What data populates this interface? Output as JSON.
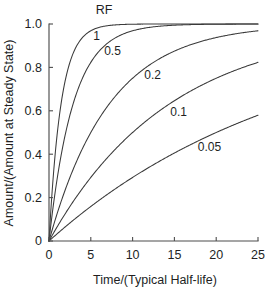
{
  "chart_data": {
    "type": "line",
    "title": "RF",
    "xlabel": "Time/(Typical Half-life)",
    "ylabel": "Amount/(Amount at Steady State)",
    "xlim": [
      0,
      25
    ],
    "ylim": [
      0,
      1.0
    ],
    "grid": false,
    "legend_position": "inline-curve-labels",
    "xticks": [
      0,
      5,
      10,
      15,
      20,
      25
    ],
    "xtick_labels": [
      "0",
      "5",
      "10",
      "15",
      "20",
      "25"
    ],
    "yticks": [
      0,
      0.2,
      0.4,
      0.6,
      0.8,
      1.0
    ],
    "ytick_labels": [
      "0",
      "0.2",
      "0.4",
      "0.6",
      "0.8",
      "1.0"
    ],
    "curve_color": "#3a3a3a",
    "axis_color": "#4d4d4d",
    "background_color": "#ffffff",
    "x": [
      0,
      0.5,
      1,
      1.5,
      2,
      2.5,
      3,
      4,
      5,
      6,
      7,
      8,
      9,
      10,
      11,
      12,
      13,
      14,
      15,
      16,
      17,
      18,
      19,
      20,
      21,
      22,
      23,
      24,
      25
    ],
    "series": [
      {
        "name": "1",
        "rf": 1,
        "label": "1",
        "values": [
          0,
          0.293,
          0.5,
          0.646,
          0.75,
          0.823,
          0.875,
          0.938,
          0.969,
          0.984,
          0.992,
          0.996,
          0.998,
          0.999,
          1.0,
          1.0,
          1.0,
          1.0,
          1.0,
          1.0,
          1.0,
          1.0,
          1.0,
          1.0,
          1.0,
          1.0,
          1.0,
          1.0,
          1.0
        ]
      },
      {
        "name": "0.5",
        "rf": 0.5,
        "label": "0.5",
        "values": [
          0,
          0.159,
          0.293,
          0.407,
          0.5,
          0.58,
          0.646,
          0.75,
          0.823,
          0.875,
          0.912,
          0.938,
          0.956,
          0.969,
          0.978,
          0.984,
          0.989,
          0.992,
          0.994,
          0.996,
          0.997,
          0.998,
          0.999,
          0.999,
          0.999,
          1.0,
          1.0,
          1.0,
          1.0
        ]
      },
      {
        "name": "0.2",
        "rf": 0.2,
        "label": "0.2",
        "values": [
          0,
          0.066,
          0.129,
          0.188,
          0.242,
          0.293,
          0.341,
          0.427,
          0.5,
          0.565,
          0.62,
          0.669,
          0.711,
          0.75,
          0.78,
          0.81,
          0.835,
          0.857,
          0.875,
          0.891,
          0.905,
          0.918,
          0.929,
          0.938,
          0.946,
          0.952,
          0.958,
          0.963,
          0.968
        ]
      },
      {
        "name": "0.1",
        "rf": 0.1,
        "label": "0.1",
        "values": [
          0,
          0.034,
          0.067,
          0.099,
          0.129,
          0.159,
          0.188,
          0.242,
          0.293,
          0.341,
          0.386,
          0.427,
          0.465,
          0.5,
          0.533,
          0.565,
          0.592,
          0.62,
          0.646,
          0.669,
          0.69,
          0.711,
          0.73,
          0.75,
          0.765,
          0.78,
          0.796,
          0.81,
          0.823
        ]
      },
      {
        "name": "0.05",
        "rf": 0.05,
        "label": "0.05",
        "values": [
          0,
          0.017,
          0.034,
          0.051,
          0.067,
          0.083,
          0.099,
          0.129,
          0.159,
          0.188,
          0.216,
          0.242,
          0.268,
          0.293,
          0.317,
          0.341,
          0.364,
          0.386,
          0.407,
          0.427,
          0.447,
          0.465,
          0.484,
          0.5,
          0.518,
          0.533,
          0.549,
          0.565,
          0.577
        ]
      }
    ],
    "annotations": [
      {
        "text": "1",
        "x": 5.7,
        "y": 0.925
      },
      {
        "text": "0.5",
        "x": 7.6,
        "y": 0.855
      },
      {
        "text": "0.2",
        "x": 12.4,
        "y": 0.745
      },
      {
        "text": "0.1",
        "x": 15.5,
        "y": 0.575
      },
      {
        "text": "0.05",
        "x": 19.2,
        "y": 0.415
      }
    ]
  }
}
